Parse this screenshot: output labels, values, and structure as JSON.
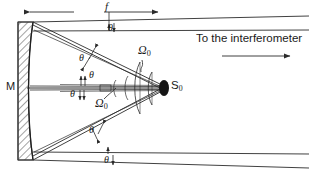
{
  "figure": {
    "type": "optical-ray-diagram",
    "background_color": "#ffffff",
    "line_color": "#2b2b2b",
    "source_fill_color": "#151515",
    "hatch_color": "#555555"
  },
  "labels": {
    "mirror": "M",
    "focal_length": "f",
    "source": "S",
    "source_subscript": "0",
    "solid_angle": "Ω",
    "solid_angle_subscript": "0",
    "theta": "θ",
    "destination": "To the interferometer"
  },
  "annotations": [
    {
      "name": "theta-top-beam",
      "text": "θ",
      "x": 112,
      "y": 28
    },
    {
      "name": "theta-upper-ray",
      "text": "θ",
      "x": 82,
      "y": 57
    },
    {
      "name": "theta-axis-upper",
      "text": "θ",
      "x": 90,
      "y": 73
    },
    {
      "name": "theta-axis-lower",
      "text": "θ",
      "x": 71,
      "y": 92
    },
    {
      "name": "theta-lower-ray",
      "text": "θ",
      "x": 89,
      "y": 128
    },
    {
      "name": "theta-bottom-beam",
      "text": "θ",
      "x": 104,
      "y": 159
    }
  ],
  "solid_angles": [
    {
      "name": "omega-upper",
      "x": 138,
      "y": 48
    },
    {
      "name": "omega-lower",
      "x": 95,
      "y": 100
    }
  ],
  "dimension": {
    "name": "focal-length-dimension",
    "label": "f",
    "x_start": 28,
    "x_end": 160,
    "y": 12
  },
  "geometry": {
    "mirror_x_left": 18,
    "mirror_x_right": 33,
    "mirror_y_top": 22,
    "mirror_y_bottom": 160,
    "source_x": 164,
    "source_y": 88,
    "axis_y": 88
  }
}
